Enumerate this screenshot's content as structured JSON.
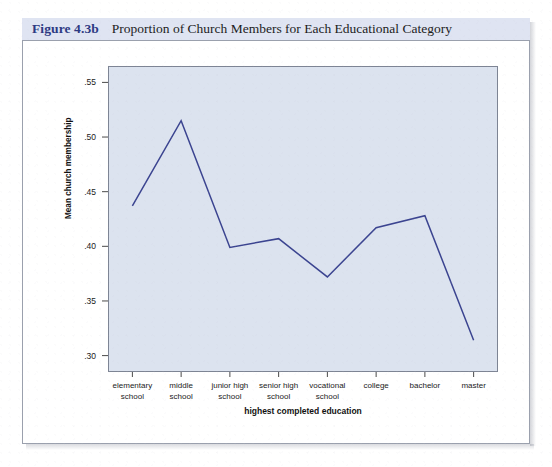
{
  "figure": {
    "label": "Figure 4.3b",
    "caption": "Proportion of Church Members for Each Educational Category",
    "label_color": "#2d3a83",
    "caption_bar_color": "#dfe4f2"
  },
  "chart_data": {
    "type": "line",
    "title": "Proportion of Church Members for Each Educational Category",
    "xlabel": "highest completed education",
    "ylabel": "Mean church membership",
    "categories": [
      "elementary school",
      "middle school",
      "junior high school",
      "senior high school",
      "vocational school",
      "college",
      "bachelor",
      "master"
    ],
    "category_lines": [
      [
        "elementary",
        "school"
      ],
      [
        "middle",
        "school"
      ],
      [
        "junior high",
        "school"
      ],
      [
        "senior high",
        "school"
      ],
      [
        "vocational",
        "school"
      ],
      [
        "college",
        ""
      ],
      [
        "bachelor",
        ""
      ],
      [
        "master",
        ""
      ]
    ],
    "values": [
      0.437,
      0.515,
      0.399,
      0.407,
      0.372,
      0.417,
      0.428,
      0.314
    ],
    "ylim": [
      0.285,
      0.565
    ],
    "yticks": [
      0.3,
      0.35,
      0.4,
      0.45,
      0.5,
      0.55
    ],
    "ytick_labels": [
      ".30",
      ".35",
      ".40",
      ".45",
      ".50",
      ".55"
    ],
    "grid": false,
    "legend": false,
    "line_color": "#3b4490",
    "plot_background": "#dce3ef",
    "marker": "none"
  }
}
